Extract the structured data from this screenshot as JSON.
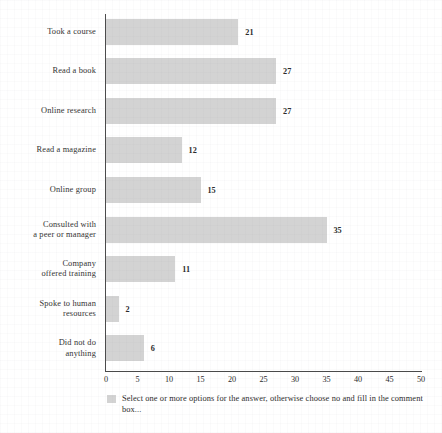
{
  "chart_data": {
    "type": "bar",
    "orientation": "horizontal",
    "title": "",
    "subtitle": "",
    "xlabel": "",
    "ylabel": "",
    "xlim": [
      0,
      50
    ],
    "xticks": [
      0,
      5,
      10,
      15,
      20,
      25,
      30,
      35,
      40,
      45,
      50
    ],
    "xtick_labels": [
      "0",
      "5",
      "10",
      "15",
      "20",
      "25",
      "30",
      "35",
      "40",
      "45",
      "50"
    ],
    "grid": false,
    "legend_position": "below-axis",
    "bar_color": "#d3d3d3",
    "axis_color": "#4a4a4a",
    "categories": [
      "Took a course",
      "Read a book",
      "Online research",
      "Read a magazine",
      "Online group",
      "Consulted with\na peer or manager",
      "Company\noffered training",
      "Spoke to human\nresources",
      "Did not do\nanything"
    ],
    "values": [
      21,
      27,
      27,
      12,
      15,
      35,
      11,
      2,
      6
    ],
    "value_labels": [
      "21",
      "27",
      "27",
      "12",
      "15",
      "35",
      "11",
      "2",
      "6"
    ],
    "series": [
      {
        "name": "Select one or more options for the answer, otherwise choose no and fill in the comment box...",
        "values": [
          21,
          27,
          27,
          12,
          15,
          35,
          11,
          2,
          6
        ]
      }
    ]
  },
  "rows": [
    {
      "label_line1": "Took a course",
      "label_line2": "",
      "value": 21,
      "value_label": "21"
    },
    {
      "label_line1": "Read a book",
      "label_line2": "",
      "value": 27,
      "value_label": "27"
    },
    {
      "label_line1": "Online research",
      "label_line2": "",
      "value": 27,
      "value_label": "27"
    },
    {
      "label_line1": "Read a magazine",
      "label_line2": "",
      "value": 12,
      "value_label": "12"
    },
    {
      "label_line1": "Online group",
      "label_line2": "",
      "value": 15,
      "value_label": "15"
    },
    {
      "label_line1": "Consulted with",
      "label_line2": "a peer or manager",
      "value": 35,
      "value_label": "35"
    },
    {
      "label_line1": "Company",
      "label_line2": "offered training",
      "value": 11,
      "value_label": "11"
    },
    {
      "label_line1": "Spoke to human",
      "label_line2": "resources",
      "value": 2,
      "value_label": "2"
    },
    {
      "label_line1": "Did not do",
      "label_line2": "anything",
      "value": 6,
      "value_label": "6"
    }
  ],
  "xaxis": {
    "ticks": [
      "0",
      "5",
      "10",
      "15",
      "20",
      "25",
      "30",
      "35",
      "40",
      "45",
      "50"
    ]
  },
  "legend": {
    "swatch_color": "#d3d3d3",
    "caption": "Select one or more options for the answer, otherwise choose no and fill in the comment box..."
  }
}
